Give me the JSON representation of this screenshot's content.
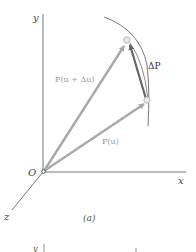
{
  "figure_a": {
    "axes": {
      "x_label": "x",
      "y_label": "y",
      "z_label": "z",
      "origin_label": "O"
    },
    "vectors": {
      "p_u_label": "P(u)",
      "p_u_du_label": "P(u + Δu)",
      "delta_p_label": "ΔP"
    },
    "caption": "(a)",
    "colors": {
      "axis": "#777777",
      "vector": "#a8a8a8",
      "delta_vector": "#666666",
      "curve": "#555555",
      "point_fill": "#e8e8e8",
      "point_stroke": "#aaaaaa"
    }
  },
  "figure_b_partial": {
    "y_label": "y",
    "marker": "↑"
  }
}
